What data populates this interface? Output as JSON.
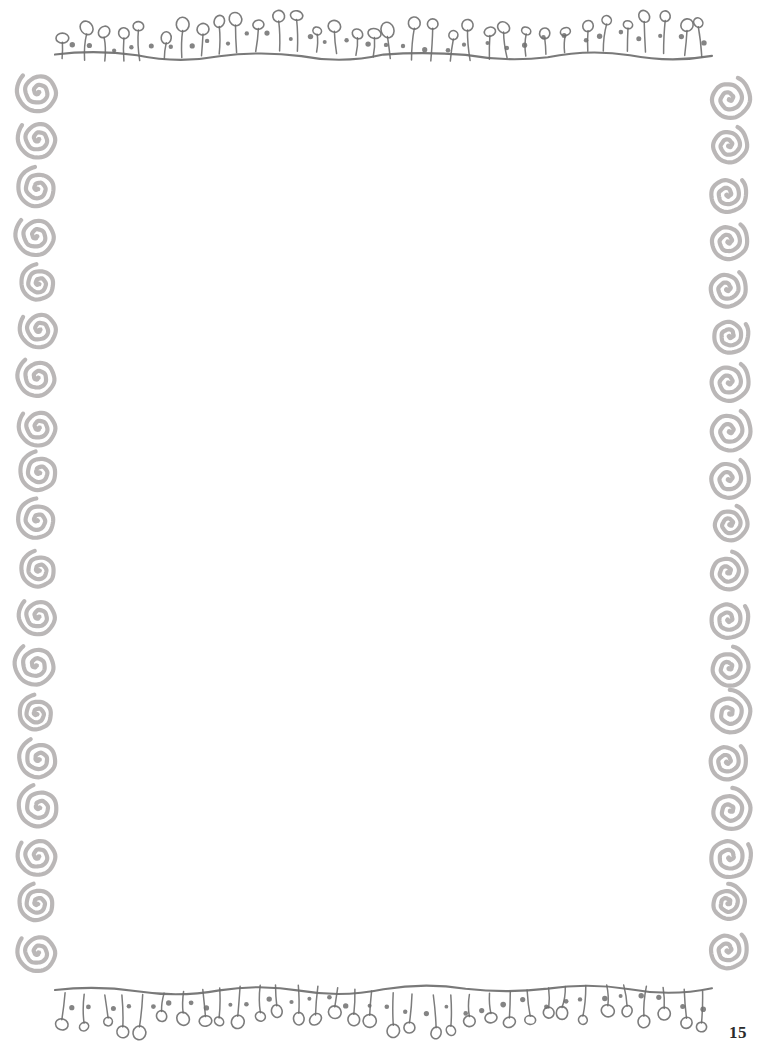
{
  "page": {
    "width": 765,
    "height": 1053,
    "background_color": "#ffffff",
    "kind": "decorative-blank-stationery-page",
    "body_text": ""
  },
  "page_number": {
    "label": "15",
    "color": "#2b2b2b",
    "position": "bottom-right"
  },
  "decoration": {
    "line_color": "#6e6e6e",
    "spiral_color": "#b6b3b3",
    "top_border": {
      "name": "flower-stem-wavy-line-top",
      "description": "hand-drawn wavy horizontal line with upright stems topped by small ellipses and scattered round dots",
      "x_start": 55,
      "x_end": 712,
      "baseline_y": 56,
      "stem_direction": "up",
      "stem_count": 34,
      "dot_count": 33
    },
    "bottom_border": {
      "name": "flower-stem-wavy-line-bottom",
      "description": "hand-drawn wavy horizontal line with pendant stems ending in small ellipses and scattered round dots",
      "x_start": 55,
      "x_end": 712,
      "baseline_y": 990,
      "stem_direction": "down",
      "stem_count": 34,
      "dot_count": 33
    },
    "left_spiral_column": {
      "name": "spiral-column-left",
      "center_x": 38,
      "y_start": 68,
      "y_end": 975,
      "count": 19,
      "spiral_size": 42,
      "orientation": "tail-left"
    },
    "right_spiral_column": {
      "name": "spiral-column-right",
      "center_x": 728,
      "y_start": 75,
      "y_end": 975,
      "count": 19,
      "spiral_size": 42,
      "orientation": "tail-right"
    }
  }
}
